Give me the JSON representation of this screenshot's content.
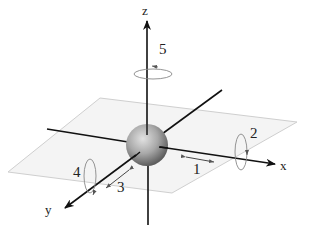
{
  "diagram": {
    "type": "3d-axes-degrees-of-freedom",
    "axes": [
      {
        "name": "x",
        "label": "x"
      },
      {
        "name": "y",
        "label": "y"
      },
      {
        "name": "z",
        "label": "z"
      }
    ],
    "motions": [
      {
        "id": 1,
        "label": "1",
        "kind": "translation",
        "axis": "x"
      },
      {
        "id": 2,
        "label": "2",
        "kind": "rotation",
        "axis": "x"
      },
      {
        "id": 3,
        "label": "3",
        "kind": "translation",
        "axis": "y"
      },
      {
        "id": 4,
        "label": "4",
        "kind": "rotation",
        "axis": "y"
      },
      {
        "id": 5,
        "label": "5",
        "kind": "rotation",
        "axis": "z"
      }
    ],
    "colors": {
      "axis": "#111111",
      "plane_fill": "#f4f4f4",
      "plane_edge": "#cfcfcf",
      "sphere_light": "#d8d8d8",
      "sphere_dark": "#6a6a6a",
      "motion_arrow": "#777777"
    }
  }
}
